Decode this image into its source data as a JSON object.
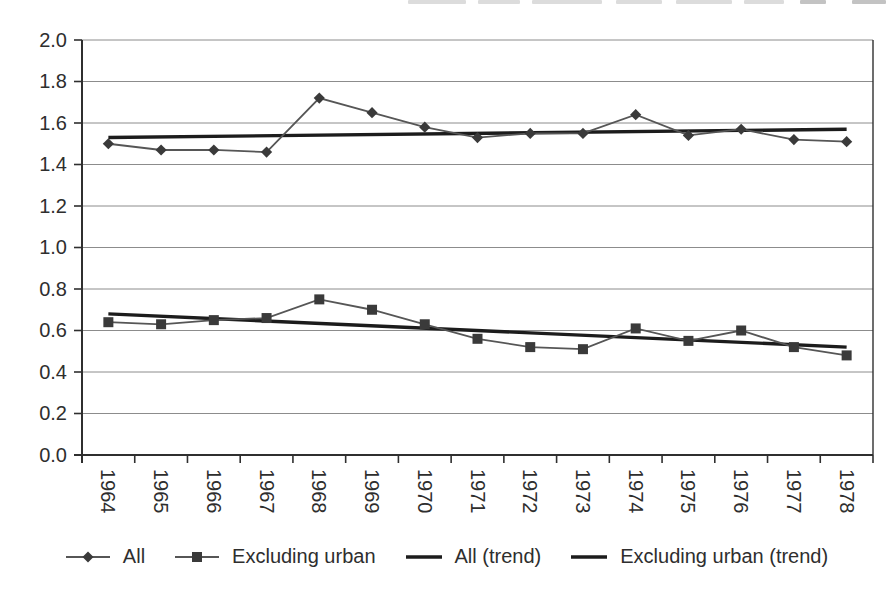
{
  "chart_data": {
    "type": "line",
    "categories": [
      "1964",
      "1965",
      "1966",
      "1967",
      "1968",
      "1969",
      "1970",
      "1971",
      "1972",
      "1973",
      "1974",
      "1975",
      "1976",
      "1977",
      "1978"
    ],
    "series": [
      {
        "name": "All",
        "marker": "diamond",
        "values": [
          1.5,
          1.47,
          1.47,
          1.46,
          1.72,
          1.65,
          1.58,
          1.53,
          1.55,
          1.55,
          1.64,
          1.54,
          1.57,
          1.52,
          1.51
        ]
      },
      {
        "name": "Excluding urban",
        "marker": "square",
        "values": [
          0.64,
          0.63,
          0.65,
          0.66,
          0.75,
          0.7,
          0.63,
          0.56,
          0.52,
          0.51,
          0.61,
          0.55,
          0.6,
          0.52,
          0.48
        ]
      },
      {
        "name": "All (trend)",
        "marker": "none",
        "trend": {
          "start": 1.53,
          "end": 1.57
        }
      },
      {
        "name": "Excluding urban (trend)",
        "marker": "none",
        "trend": {
          "start": 0.68,
          "end": 0.52
        }
      }
    ],
    "ylim": [
      0.0,
      2.0
    ],
    "ytick_step": 0.2,
    "y_tick_labels": [
      "0.0",
      "0.2",
      "0.4",
      "0.6",
      "0.8",
      "1.0",
      "1.2",
      "1.4",
      "1.6",
      "1.8",
      "2.0"
    ],
    "grid": true,
    "legend_position": "bottom",
    "colors": {
      "series_line": "#565656",
      "marker": "#3a3a3a",
      "trend_line": "#1c1c1c",
      "gridline": "#8c8c8c",
      "axis": "#2f2f2f",
      "text": "#2e2e2e",
      "background": "#ffffff"
    }
  },
  "legend": {
    "items": [
      {
        "label": "All",
        "marker": "diamond-on-line"
      },
      {
        "label": "Excluding urban",
        "marker": "square-on-line"
      },
      {
        "label": "All (trend)",
        "marker": "line"
      },
      {
        "label": "Excluding urban (trend)",
        "marker": "line"
      }
    ]
  }
}
